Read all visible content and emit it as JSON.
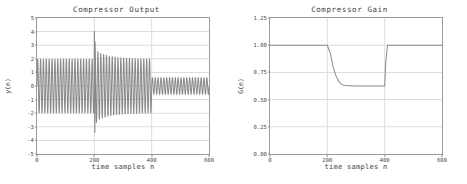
{
  "figure": {
    "background": "#ffffff",
    "line_color": "#8a8a8a",
    "grid_color": "#dedede",
    "axis_color": "#9a9a9a",
    "text_color": "#3d3d3d"
  },
  "panels": [
    {
      "key": "output",
      "title": "Compressor Output",
      "xlabel": "time samples n",
      "ylabel": "y(n)",
      "xticks": [
        "0",
        "200",
        "400",
        "600"
      ],
      "yticks": [
        "5",
        "4",
        "3",
        "2",
        "1",
        "0",
        "-1",
        "-2",
        "-3",
        "-4",
        "-5"
      ]
    },
    {
      "key": "gain",
      "title": "Compressor Gain",
      "xlabel": "time samples n",
      "ylabel": "G(n)",
      "xticks": [
        "0",
        "200",
        "400",
        "600"
      ],
      "yticks": [
        "1.25",
        "1.00",
        "0.75",
        "0.50",
        "0.25",
        "0.00"
      ]
    }
  ],
  "chart_data": [
    {
      "type": "line",
      "key": "output",
      "title": "Compressor Output",
      "xlabel": "time samples n",
      "ylabel": "y(n)",
      "xlim": [
        0,
        600
      ],
      "ylim": [
        -5,
        5
      ],
      "xticks": [
        0,
        200,
        400,
        600
      ],
      "yticks": [
        -5,
        -4,
        -3,
        -2,
        -1,
        0,
        1,
        2,
        3,
        4,
        5
      ],
      "grid": true,
      "legend": "none",
      "description": "Oscillating sinusoidal burst signal, carrier period about 10 samples. Amplitude 2.0 for n=0..200; a transient spike reaching +4.0 and -3.4 at n=200 followed by exponential settling from 2.5 down to 2.0 across n=200..400; amplitude drops abruptly to 0.6 for n=400..600.",
      "segments": [
        {
          "n_start": 0,
          "n_end": 200,
          "amplitude_start": 2.0,
          "amplitude_end": 2.0
        },
        {
          "n_start": 200,
          "n_end": 215,
          "amplitude_start": 4.0,
          "amplitude_end": 2.5
        },
        {
          "n_start": 215,
          "n_end": 400,
          "amplitude_start": 2.5,
          "amplitude_end": 2.0
        },
        {
          "n_start": 400,
          "n_end": 600,
          "amplitude_start": 0.6,
          "amplitude_end": 0.6
        }
      ],
      "carrier_period_samples": 10,
      "peak_positive": 4.0,
      "peak_negative": -3.4
    },
    {
      "type": "line",
      "key": "gain",
      "title": "Compressor Gain",
      "xlabel": "time samples n",
      "ylabel": "G(n)",
      "xlim": [
        0,
        600
      ],
      "ylim": [
        0.0,
        1.25
      ],
      "xticks": [
        0,
        200,
        400,
        600
      ],
      "yticks": [
        0.0,
        0.25,
        0.5,
        0.75,
        1.0,
        1.25
      ],
      "grid": true,
      "legend": "none",
      "description": "Gain held at 1.00 for n=0..200, exponential attack decay to a floor of 0.625 reached near n=250, held until n=400, then fast release step back to 1.00 and held to n=600.",
      "x": [
        0,
        200,
        210,
        220,
        230,
        240,
        250,
        260,
        300,
        350,
        395,
        400,
        404,
        410,
        600
      ],
      "y": [
        1.0,
        1.0,
        0.93,
        0.8,
        0.72,
        0.665,
        0.64,
        0.63,
        0.625,
        0.625,
        0.625,
        0.625,
        0.85,
        1.0,
        1.0
      ],
      "plateau_value": 0.625,
      "nominal_value": 1.0,
      "attack_start_n": 200,
      "release_start_n": 400
    }
  ]
}
